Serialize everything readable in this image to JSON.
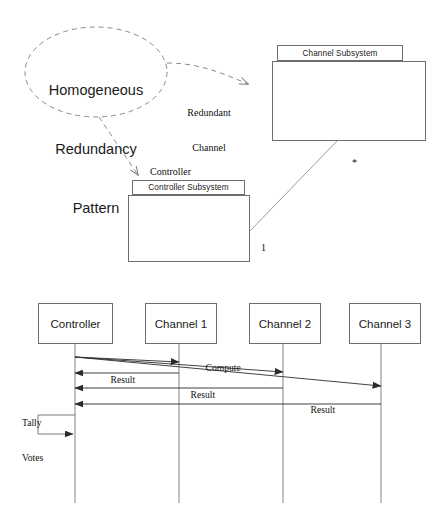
{
  "diagram": {
    "title": "Homogeneous Redundancy Pattern",
    "pattern_ellipse": {
      "line1": "Homogeneous",
      "line2": "Redundancy",
      "line3": "Pattern",
      "border_style": "dashed",
      "stroke_color": "#8a8a8a"
    },
    "packages": [
      {
        "id": "channel-subsystem",
        "name": "Channel Subsystem",
        "tab": {
          "x": 277,
          "y": 45,
          "w": 126,
          "h": 16
        },
        "body": {
          "x": 272,
          "y": 61,
          "w": 154,
          "h": 80
        }
      },
      {
        "id": "controller-subsystem",
        "name": "Controller Subsystem",
        "tab": {
          "x": 132,
          "y": 180,
          "w": 113,
          "h": 15
        },
        "body": {
          "x": 128,
          "y": 195,
          "w": 122,
          "h": 67
        }
      }
    ],
    "role_labels": [
      {
        "id": "redundant-channel",
        "line1": "Redundant",
        "line2": "Channel",
        "x": 183,
        "y": 85
      },
      {
        "id": "controller-role",
        "text": "Controller",
        "x": 144,
        "y": 155
      }
    ],
    "multiplicities": [
      {
        "id": "channel-end",
        "text": "*",
        "x": 342,
        "y": 146
      },
      {
        "id": "controller-end",
        "text": "1",
        "x": 250,
        "y": 231
      }
    ],
    "stroke_color": "#6e6e6e",
    "line_color": "#444444"
  },
  "sequence": {
    "lifelines": [
      {
        "id": "controller",
        "label": "Controller",
        "box": {
          "x": 38,
          "y": 303,
          "w": 75,
          "h": 41
        },
        "line_x": 75,
        "line_bottom": 503
      },
      {
        "id": "channel-1",
        "label": "Channel 1",
        "box": {
          "x": 145,
          "y": 303,
          "w": 72,
          "h": 41
        },
        "line_x": 179,
        "line_bottom": 503
      },
      {
        "id": "channel-2",
        "label": "Channel 2",
        "box": {
          "x": 249,
          "y": 303,
          "w": 72,
          "h": 41
        },
        "line_x": 283,
        "line_bottom": 503
      },
      {
        "id": "channel-3",
        "label": "Channel 3",
        "box": {
          "x": 349,
          "y": 303,
          "w": 72,
          "h": 41
        },
        "line_x": 381,
        "line_bottom": 503
      }
    ],
    "messages": [
      {
        "id": "compute-ch1",
        "label": "Compute",
        "from": "controller",
        "to": "channel-1",
        "x1": 75,
        "y1": 357,
        "x2": 179,
        "y2": 362,
        "label_x": 196,
        "label_y": 357
      },
      {
        "id": "compute-ch2",
        "label": "",
        "from": "controller",
        "to": "channel-2",
        "x1": 75,
        "y1": 357,
        "x2": 283,
        "y2": 372,
        "label_x": 0,
        "label_y": 0
      },
      {
        "id": "compute-ch3",
        "label": "",
        "from": "controller",
        "to": "channel-3",
        "x1": 75,
        "y1": 357,
        "x2": 381,
        "y2": 386,
        "label_x": 0,
        "label_y": 0
      },
      {
        "id": "result-ch1",
        "label": "Result",
        "from": "channel-1",
        "to": "controller",
        "x1": 179,
        "y1": 373,
        "x2": 75,
        "y2": 373,
        "label_x": 101,
        "label_y": 368
      },
      {
        "id": "result-ch2",
        "label": "Result",
        "from": "channel-2",
        "to": "controller",
        "x1": 283,
        "y1": 388,
        "x2": 75,
        "y2": 388,
        "label_x": 180,
        "label_y": 382
      },
      {
        "id": "result-ch3",
        "label": "Result",
        "from": "channel-3",
        "to": "controller",
        "x1": 381,
        "y1": 404,
        "x2": 75,
        "y2": 404,
        "label_x": 300,
        "label_y": 398
      }
    ],
    "self_message": {
      "id": "tally-votes",
      "line1": "Tally",
      "line2": "Votes",
      "label_x": 22,
      "label_y": 398,
      "start_x": 75,
      "start_y": 415,
      "left_x": 38,
      "end_y": 434
    },
    "arrow_color": "#2b2b2b",
    "box_stroke": "#6e6e6e"
  }
}
